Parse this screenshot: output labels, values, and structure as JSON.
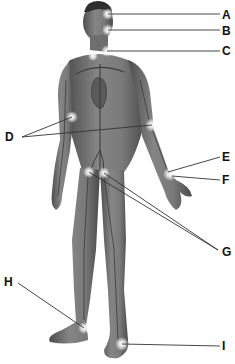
{
  "diagram": {
    "colors": {
      "skin": "#7a7a7a",
      "skin_dark": "#4a4a4a",
      "vessel": "#3c3c3c",
      "glow": "#ffffff",
      "leader_line": "#333333",
      "label": "#111111"
    },
    "labels": [
      {
        "id": "A",
        "text": "A",
        "x": 222,
        "y": 9,
        "targets": [
          [
            108,
            14
          ]
        ],
        "line_end": [
          220,
          14
        ]
      },
      {
        "id": "B",
        "text": "B",
        "x": 222,
        "y": 25,
        "targets": [
          [
            108,
            30
          ]
        ],
        "line_end": [
          220,
          30
        ]
      },
      {
        "id": "C",
        "text": "C",
        "x": 222,
        "y": 45,
        "targets": [
          [
            107,
            51
          ]
        ],
        "line_end": [
          220,
          51
        ]
      },
      {
        "id": "D",
        "text": "D",
        "x": 5,
        "y": 131,
        "targets": [
          [
            72,
            117
          ],
          [
            152,
            125
          ]
        ],
        "line_end": [
          22,
          137
        ]
      },
      {
        "id": "E",
        "text": "E",
        "x": 222,
        "y": 151,
        "targets": [
          [
            168,
            172
          ]
        ],
        "line_end": [
          220,
          157
        ]
      },
      {
        "id": "F",
        "text": "F",
        "x": 222,
        "y": 174,
        "targets": [
          [
            172,
            176
          ]
        ],
        "line_end": [
          220,
          180
        ]
      },
      {
        "id": "G",
        "text": "G",
        "x": 222,
        "y": 246,
        "targets": [
          [
            89,
            172
          ],
          [
            104,
            173
          ]
        ],
        "line_end": [
          218,
          250
        ]
      },
      {
        "id": "H",
        "text": "H",
        "x": 4,
        "y": 276,
        "targets": [
          [
            84,
            328
          ]
        ],
        "line_end": [
          18,
          283
        ]
      },
      {
        "id": "I",
        "text": "I",
        "x": 222,
        "y": 340,
        "targets": [
          [
            122,
            344
          ]
        ],
        "line_end": [
          220,
          346
        ]
      }
    ]
  }
}
